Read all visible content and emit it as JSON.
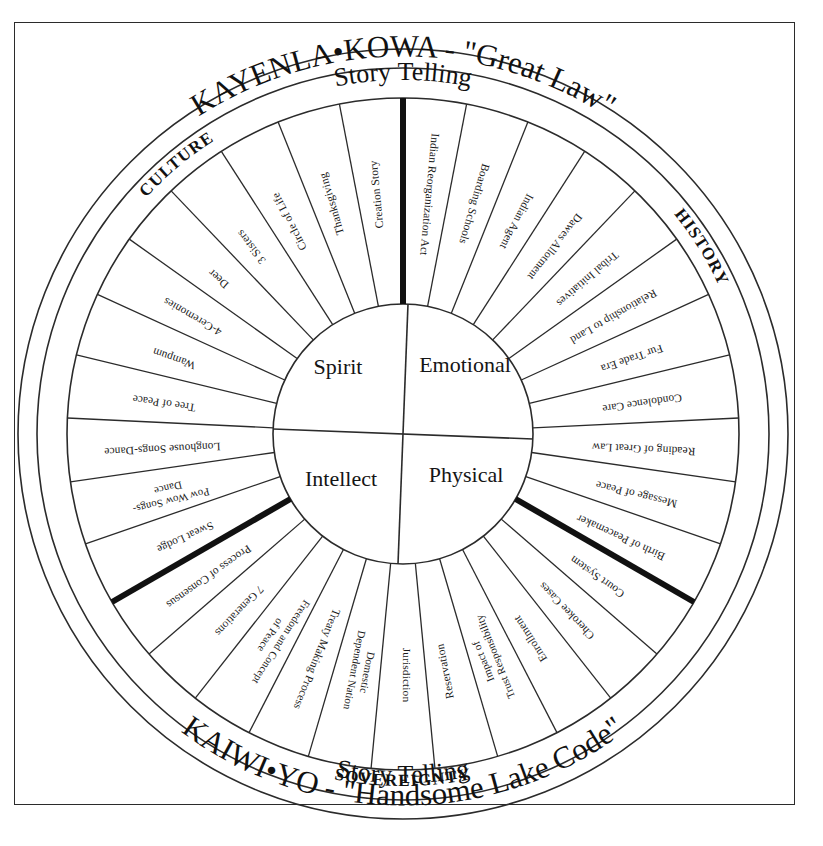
{
  "diagram": {
    "title_top_outer": "KAYENLA•KOWA - \"Great Law\"",
    "title_top_inner": "Story Telling",
    "title_bottom_outer": "KAIWI•YO - \"Handsome Lake Code\"",
    "title_bottom_inner": "Story Telling",
    "core": {
      "top_left": "Spirit",
      "top_right": "Emotional",
      "bottom_left": "Intellect",
      "bottom_right": "Physical"
    },
    "quadrant_labels": {
      "culture": "CULTURE",
      "history": "HISTORY",
      "sovereignty": "SOVEREIGNTY"
    },
    "colors": {
      "ink": "#2b2b2b",
      "heavy_divider": "#111111",
      "background": "#ffffff"
    },
    "segments_clockwise_from_top": [
      {
        "id": "indian-reorganization-act",
        "label": "Indian Reorganization Act",
        "quadrant": "history"
      },
      {
        "id": "boarding-schools",
        "label": "Boarding Schools",
        "quadrant": "history"
      },
      {
        "id": "indian-agent",
        "label": "Indian Agent",
        "quadrant": "history"
      },
      {
        "id": "dawes-allotment",
        "label": "Dawes Allotment",
        "quadrant": "history"
      },
      {
        "id": "tribal-initiatives",
        "label": "Tribal Initiatives",
        "quadrant": "history"
      },
      {
        "id": "relationship-to-land",
        "label": "Relationship to Land",
        "quadrant": "history"
      },
      {
        "id": "fur-trade-era",
        "label": "Fur Trade Era",
        "quadrant": "history"
      },
      {
        "id": "condolence-care",
        "label": "Condolence Care",
        "quadrant": "history"
      },
      {
        "id": "reading-of-great-law",
        "label": "Reading of Great Law",
        "quadrant": "history"
      },
      {
        "id": "message-of-peace",
        "label": "Message of Peace",
        "quadrant": "history"
      },
      {
        "id": "birth-of-peacemaker",
        "label": "Birth of Peacemaker",
        "quadrant": "history"
      },
      {
        "id": "court-system",
        "label": "Court System",
        "quadrant": "sovereignty"
      },
      {
        "id": "cherokee-cases",
        "label": "Cherokee Cases",
        "quadrant": "sovereignty"
      },
      {
        "id": "enrollment",
        "label": "Enrollment",
        "quadrant": "sovereignty"
      },
      {
        "id": "impact-of-trust-responsibility",
        "label": "Impact of\nTrust Responsibility",
        "quadrant": "sovereignty"
      },
      {
        "id": "reservation",
        "label": "Reservation",
        "quadrant": "sovereignty"
      },
      {
        "id": "jurisdiction",
        "label": "Jurisdiction",
        "quadrant": "sovereignty"
      },
      {
        "id": "domestic-dependent-nation",
        "label": "Domestic\nDependent Nation",
        "quadrant": "sovereignty"
      },
      {
        "id": "treaty-making-process",
        "label": "Treaty Making Process",
        "quadrant": "sovereignty"
      },
      {
        "id": "freedom-and-concept-of-peace",
        "label": "Freedom and Concept\nof Peace",
        "quadrant": "sovereignty"
      },
      {
        "id": "7-generations",
        "label": "7 Generations",
        "quadrant": "sovereignty"
      },
      {
        "id": "process-of-consensus",
        "label": "Process of Consensus",
        "quadrant": "sovereignty"
      },
      {
        "id": "sweat-lodge",
        "label": "Sweat Lodge",
        "quadrant": "culture"
      },
      {
        "id": "pow-wow-songs-dance",
        "label": "Pow Wow Songs-\nDance",
        "quadrant": "culture"
      },
      {
        "id": "longhouse-songs-dance",
        "label": "Longhouse Songs-Dance",
        "quadrant": "culture"
      },
      {
        "id": "tree-of-peace",
        "label": "Tree of Peace",
        "quadrant": "culture"
      },
      {
        "id": "wampum",
        "label": "Wampum",
        "quadrant": "culture"
      },
      {
        "id": "4-ceremonies",
        "label": "4-Ceremonies",
        "quadrant": "culture"
      },
      {
        "id": "deer",
        "label": "Deer",
        "quadrant": "culture"
      },
      {
        "id": "3-sisters",
        "label": "3 Sisters",
        "quadrant": "culture"
      },
      {
        "id": "circle-of-life",
        "label": "Circle of Life",
        "quadrant": "culture"
      },
      {
        "id": "thanksgiving",
        "label": "Thanksgiving",
        "quadrant": "culture"
      },
      {
        "id": "creation-story",
        "label": "Creation Story",
        "quadrant": "culture"
      }
    ]
  }
}
